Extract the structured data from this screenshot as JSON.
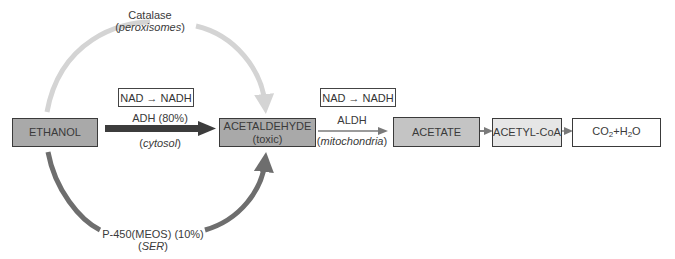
{
  "diagram": {
    "nodes": {
      "ethanol": {
        "label": "ETHANOL",
        "fill": "#a9a9a9"
      },
      "acetaldehyde": {
        "label": "ACETALDEHYDE",
        "sublabel": "(toxic)",
        "fill": "#a9a9a9"
      },
      "acetate": {
        "label": "ACETATE",
        "fill": "#c4c4c4"
      },
      "acetyl_coa": {
        "label": "ACETYL-CoA",
        "fill": "#e6e6e6"
      },
      "co2_h2o": {
        "co2": "CO",
        "sub2": "2",
        "plus": "+H",
        "h2o_o": "O",
        "fill": "#ffffff"
      }
    },
    "cofactor_boxes": [
      {
        "label": "NAD → NADH"
      },
      {
        "label": "NAD → NADH"
      }
    ],
    "edges": {
      "adh": {
        "enzyme": "ADH (80%)",
        "location": "cytosol",
        "color": "#3c3c3c"
      },
      "catalase": {
        "enzyme": "Catalase",
        "location": "peroxisomes",
        "color": "#d4d4d4"
      },
      "p450": {
        "enzyme": "P-450(MEOS) (10%)",
        "location": "SER",
        "color": "#6e6e6e"
      },
      "aldh": {
        "enzyme": "ALDH",
        "location": "mitochondria",
        "color": "#7a7a7a"
      }
    },
    "paren_open": "(",
    "paren_close": ")"
  }
}
